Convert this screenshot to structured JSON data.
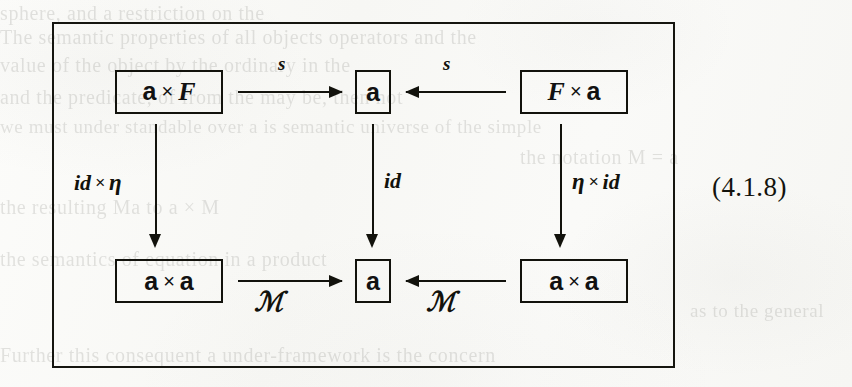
{
  "page": {
    "kind": "scanned-book-page",
    "equation_number": "(4.1.8)",
    "background_color": "#fbfbf9",
    "ink_color": "#12120c"
  },
  "diagram": {
    "type": "commutative-diagram",
    "caption": "(4.1.8)",
    "objects": [
      {
        "id": "top-left",
        "parts": [
          "a",
          "×",
          "F"
        ],
        "a": "a",
        "times": "×",
        "right": "F"
      },
      {
        "id": "top-mid",
        "parts": [
          "a"
        ],
        "a": "a"
      },
      {
        "id": "top-right",
        "parts": [
          "F",
          "×",
          "a"
        ],
        "left": "F",
        "times": "×",
        "a": "a"
      },
      {
        "id": "bottom-left",
        "parts": [
          "a",
          "×",
          "a"
        ],
        "a": "a",
        "times": "×",
        "a2": "a"
      },
      {
        "id": "bottom-mid",
        "parts": [
          "a"
        ],
        "a": "a"
      },
      {
        "id": "bottom-right",
        "parts": [
          "a",
          "×",
          "a"
        ],
        "a": "a",
        "times": "×",
        "a2": "a"
      }
    ],
    "arrows": [
      {
        "id": "top-left-to-mid",
        "from": "top-left",
        "to": "top-mid",
        "direction": "right",
        "label": "s"
      },
      {
        "id": "top-right-to-mid",
        "from": "top-right",
        "to": "top-mid",
        "direction": "left",
        "label": "s"
      },
      {
        "id": "left-vertical",
        "from": "top-left",
        "to": "bottom-left",
        "direction": "down",
        "label": "id × η"
      },
      {
        "id": "mid-vertical",
        "from": "top-mid",
        "to": "bottom-mid",
        "direction": "down",
        "label": "id"
      },
      {
        "id": "right-vertical",
        "from": "top-right",
        "to": "bottom-right",
        "direction": "down",
        "label": "η × id"
      },
      {
        "id": "bottom-left-to-mid",
        "from": "bottom-left",
        "to": "bottom-mid",
        "direction": "right",
        "label": "ℳ"
      },
      {
        "id": "bottom-right-to-mid",
        "from": "bottom-right",
        "to": "bottom-mid",
        "direction": "left",
        "label": "ℳ"
      }
    ],
    "labels": {
      "s_left": "s",
      "s_right": "s",
      "id_times_eta": {
        "id": "id",
        "times": "×",
        "eta": "η"
      },
      "id_mid": "id",
      "eta_times_id": {
        "eta": "η",
        "times": "×",
        "id": "id"
      },
      "script_m_left": "ℳ",
      "script_m_right": "ℳ"
    }
  },
  "bleed_through": {
    "note": "faint reverse-side text visible through the scanned paper",
    "lines": [
      {
        "text": "sphere, and a restriction on the",
        "x": 0,
        "y": 2,
        "size": 20
      },
      {
        "text": "The semantic properties of all objects operators and the",
        "x": 0,
        "y": 26,
        "size": 20
      },
      {
        "text": "value of the object by the ordinary in the",
        "x": 0,
        "y": 54,
        "size": 20
      },
      {
        "text": "and the predicate, of       from the may be, then not",
        "x": 0,
        "y": 86,
        "size": 20
      },
      {
        "text": "we must under  standable over a is semantic universe of the simple",
        "x": 0,
        "y": 116,
        "size": 19
      },
      {
        "text": "the notation  M = a",
        "x": 520,
        "y": 146,
        "size": 20
      },
      {
        "text": "the resulting                  Ma  to  a  ×  M",
        "x": 0,
        "y": 196,
        "size": 20
      },
      {
        "text": "the semantics of equation in a product",
        "x": 0,
        "y": 248,
        "size": 20
      },
      {
        "text": "Further  this consequent a  under-framework is the concern",
        "x": 0,
        "y": 344,
        "size": 20
      },
      {
        "text": "as to the general",
        "x": 690,
        "y": 300,
        "size": 19
      }
    ]
  }
}
